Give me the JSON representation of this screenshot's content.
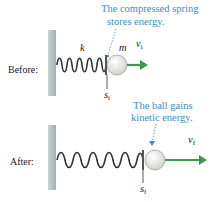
{
  "figure": {
    "before": {
      "label": "Before:",
      "annotation_line1": "The compressed spring",
      "annotation_line2": "stores energy.",
      "spring_constant_symbol": "k",
      "mass_symbol": "m",
      "velocity_symbol": "v",
      "velocity_subscript": "i",
      "position_symbol": "s",
      "position_subscript": "i"
    },
    "after": {
      "label": "After:",
      "annotation_line1": "The ball gains",
      "annotation_line2": "kinetic energy.",
      "velocity_symbol": "v",
      "velocity_subscript": "f",
      "position_symbol": "s",
      "position_subscript": "f"
    },
    "colors": {
      "annotation": "#3d8fb7",
      "arrow": "#3a9a4a",
      "wall": "#b8c4c4",
      "ball": "#e8e8e4"
    }
  }
}
